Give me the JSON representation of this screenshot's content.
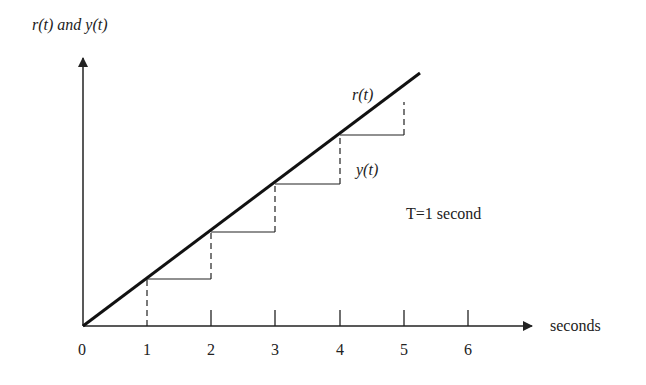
{
  "diagram": {
    "y_axis_label": "r(t) and y(t)",
    "x_axis_label": "seconds",
    "ramp_label": "r(t)",
    "staircase_label": "y(t)",
    "annotation": "T=1 second",
    "ticks": [
      "0",
      "1",
      "2",
      "3",
      "4",
      "5",
      "6"
    ]
  }
}
